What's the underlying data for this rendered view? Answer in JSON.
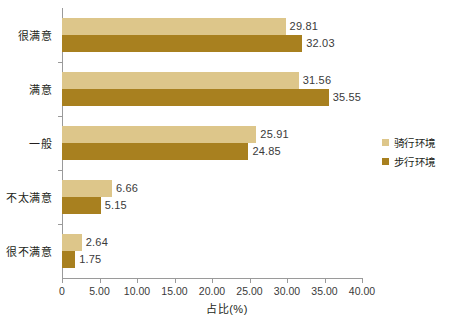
{
  "chart_data": {
    "type": "bar",
    "orientation": "horizontal",
    "title": "",
    "xlabel": "占比(%)",
    "ylabel": "",
    "categories": [
      "很满意",
      "满意",
      "一般",
      "不太满意",
      "很不满意"
    ],
    "series": [
      {
        "name": "骑行环境",
        "color": "#ddc68a",
        "values": [
          29.81,
          31.56,
          25.91,
          6.66,
          2.64
        ],
        "labels": [
          "29.81",
          "31.56",
          "25.91",
          "6.66",
          "2.64"
        ]
      },
      {
        "name": "步行环境",
        "color": "#a8801f",
        "values": [
          32.03,
          35.55,
          24.85,
          5.15,
          1.75
        ],
        "labels": [
          "32.03",
          "35.55",
          "24.85",
          "5.15",
          "1.75"
        ]
      }
    ],
    "xlim": [
      0,
      40
    ],
    "xticks": [
      0,
      5,
      10,
      15,
      20,
      25,
      30,
      35,
      40
    ],
    "xtick_labels": [
      "0",
      "5.00",
      "10.00",
      "15.00",
      "20.00",
      "25.00",
      "30.00",
      "35.00",
      "40.00"
    ],
    "grid": false,
    "legend_position": "center right",
    "axis_color": "#9a9a9a",
    "text_color": "#231f20"
  }
}
